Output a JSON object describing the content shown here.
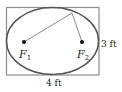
{
  "diagram": {
    "rectangle": {
      "x": 6,
      "y": 7,
      "width": 93,
      "height": 68,
      "stroke": "#8c8c8c"
    },
    "ellipse": {
      "cx": 52.5,
      "cy": 41,
      "rx": 46,
      "ry": 33.5,
      "stroke": "#555555"
    },
    "foci": [
      {
        "id": "F1",
        "label": "F",
        "subscript": "1",
        "x": 24,
        "y": 42
      },
      {
        "id": "F2",
        "label": "F",
        "subscript": "2",
        "x": 82,
        "y": 42
      }
    ],
    "point_on_ellipse": {
      "x": 72,
      "y": 13
    },
    "labels": {
      "height": "3 ft",
      "width": "4 ft"
    },
    "colors": {
      "line": "#6b6b6b",
      "text": "#231f20",
      "dot": "#111111"
    }
  }
}
